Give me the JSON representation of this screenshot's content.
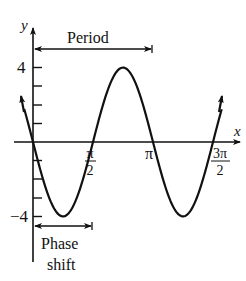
{
  "chart_data": {
    "type": "line",
    "title": "",
    "xlabel": "x",
    "ylabel": "y",
    "function": "y = 4 sin(2(x - π/2))",
    "amplitude": 4,
    "period_label": "Period",
    "phase_shift_label_line1": "Phase",
    "phase_shift_label_line2": "shift",
    "x_ticks": [
      {
        "value": 1.5708,
        "num": "π",
        "den": "2"
      },
      {
        "value": 3.1416,
        "label": "π"
      },
      {
        "value": 4.7124,
        "num": "3π",
        "den": "2"
      }
    ],
    "y_ticks": [
      {
        "value": 4,
        "label": "4"
      },
      {
        "value": -4,
        "label": "-4"
      }
    ],
    "y_minor_ticks": [
      1,
      2,
      3,
      -1,
      -2,
      -3
    ],
    "x_range": [
      -0.3,
      5.0
    ],
    "y_range": [
      -5.5,
      5.5
    ],
    "series": [
      {
        "name": "sinusoid",
        "points": [
          {
            "x": 0,
            "y": 0
          },
          {
            "x": 0.7854,
            "y": -4
          },
          {
            "x": 1.5708,
            "y": 0
          },
          {
            "x": 2.3562,
            "y": 4
          },
          {
            "x": 3.1416,
            "y": 0
          },
          {
            "x": 3.927,
            "y": -4
          },
          {
            "x": 4.7124,
            "y": 0
          }
        ]
      }
    ],
    "annotations": [
      {
        "type": "period-arrow",
        "from": 0,
        "to": 3.1416
      },
      {
        "type": "phase-shift-arrow",
        "from": 0,
        "to": 1.5708
      }
    ],
    "grid": false,
    "legend": null
  },
  "labels": {
    "y_axis": "y",
    "x_axis": "x",
    "period": "Period",
    "tick_4": "4",
    "tick_neg4": "−4",
    "pi": "π",
    "pi_half_num": "π",
    "pi_half_den": "2",
    "three_pi_half_num": "3π",
    "three_pi_half_den": "2",
    "phase": "Phase",
    "shift": "shift"
  }
}
